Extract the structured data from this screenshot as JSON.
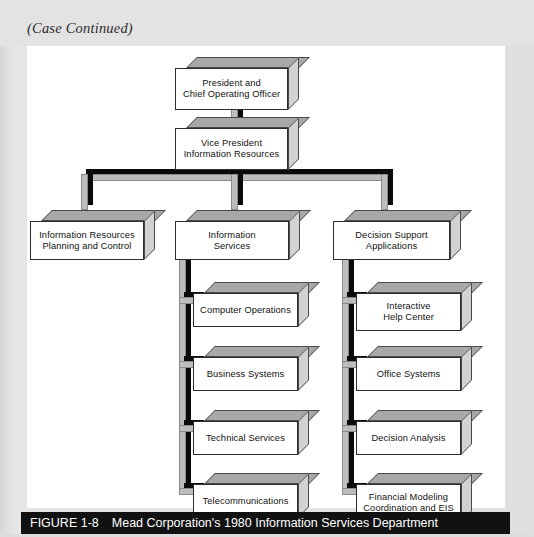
{
  "page": {
    "header_note": "(Case Continued)",
    "background_color": "#e3e3e3",
    "canvas_color": "#ffffff"
  },
  "caption": {
    "figure_number": "FIGURE 1-8",
    "title": "Mead Corporation's 1980 Information Services Department",
    "bar_color": "#111111",
    "text_color": "#ffffff"
  },
  "chart_style": {
    "box_face_color": "#ffffff",
    "box_top_color": "#a8a8a8",
    "box_side_color": "#d2d2d2",
    "connector_face_color": "#bdbdbd",
    "connector_shadow_color": "#0a0a0a",
    "outline_color": "#2e2e2e"
  },
  "org_chart": {
    "type": "organization-chart",
    "levels": 3,
    "level1": {
      "nodes": [
        {
          "id": "president",
          "label": "President and\nChief Operating Officer"
        }
      ]
    },
    "level2": {
      "nodes": [
        {
          "id": "vp",
          "label": "Vice President\nInformation Resources",
          "parent": "president"
        }
      ]
    },
    "level3": {
      "nodes": [
        {
          "id": "irpc",
          "label": "Information Resources\nPlanning and Control",
          "parent": "vp"
        },
        {
          "id": "is",
          "label": "Information\nServices",
          "parent": "vp"
        },
        {
          "id": "dsa",
          "label": "Decision Support\nApplications",
          "parent": "vp"
        }
      ]
    },
    "level4": {
      "information_services_children": [
        {
          "id": "computer-operations",
          "label": "Computer Operations",
          "parent": "is"
        },
        {
          "id": "business-systems",
          "label": "Business Systems",
          "parent": "is"
        },
        {
          "id": "technical-services",
          "label": "Technical Services",
          "parent": "is"
        },
        {
          "id": "telecommunications",
          "label": "Telecommunications",
          "parent": "is"
        }
      ],
      "decision_support_children": [
        {
          "id": "interactive-help-center",
          "label": "Interactive\nHelp Center",
          "parent": "dsa"
        },
        {
          "id": "office-systems",
          "label": "Office Systems",
          "parent": "dsa"
        },
        {
          "id": "decision-analysis",
          "label": "Decision Analysis",
          "parent": "dsa"
        },
        {
          "id": "financial-modeling",
          "label": "Financial Modeling\nCoordination and EIS",
          "parent": "dsa"
        }
      ]
    }
  }
}
